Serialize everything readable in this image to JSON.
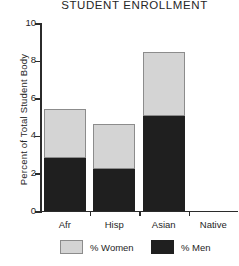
{
  "chart_data": {
    "type": "bar",
    "title": "STUDENT ENROLLMENT",
    "xlabel": "",
    "ylabel": "Percent of Total Student Body",
    "stacked": true,
    "grid": false,
    "legend_position": "bottom",
    "ylim": [
      0,
      10
    ],
    "yticks": [
      0,
      2,
      4,
      6,
      8,
      10
    ],
    "ytick_labels": [
      "0",
      "2",
      "4",
      "6",
      "8",
      "10"
    ],
    "categories": [
      "Afr",
      "Hisp",
      "Asian",
      "Native"
    ],
    "series": [
      {
        "name": "% Men",
        "color": "#1f1f1f",
        "values": [
          2.8,
          2.2,
          5.05,
          0
        ]
      },
      {
        "name": "% Women",
        "color": "#d4d4d4",
        "values": [
          2.6,
          2.4,
          3.4,
          0
        ]
      }
    ],
    "totals": [
      5.4,
      4.6,
      8.45,
      0
    ]
  },
  "legend": {
    "items": [
      {
        "label": "% Women",
        "color": "#d4d4d4"
      },
      {
        "label": "% Men",
        "color": "#1f1f1f"
      }
    ]
  }
}
